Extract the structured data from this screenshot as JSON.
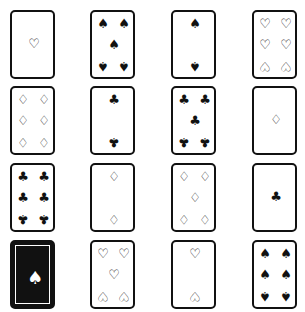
{
  "cards": [
    {
      "row": 1,
      "col": 1,
      "suit": "hearts",
      "count": 1,
      "symbol": "♡"
    },
    {
      "row": 1,
      "col": 2,
      "suit": "spades",
      "count": 5,
      "symbol": "♠"
    },
    {
      "row": 1,
      "col": 3,
      "suit": "spades",
      "count": 2,
      "symbol": "♠"
    },
    {
      "row": 1,
      "col": 4,
      "suit": "hearts",
      "count": 6,
      "symbol": "♡"
    },
    {
      "row": 2,
      "col": 1,
      "suit": "diamonds",
      "count": 6,
      "symbol": "♢"
    },
    {
      "row": 2,
      "col": 2,
      "suit": "clubs",
      "count": 2,
      "symbol": "♣"
    },
    {
      "row": 2,
      "col": 3,
      "suit": "clubs",
      "count": 5,
      "symbol": "♣"
    },
    {
      "row": 2,
      "col": 4,
      "suit": "diamonds",
      "count": 1,
      "symbol": "♢"
    },
    {
      "row": 3,
      "col": 1,
      "suit": "clubs",
      "count": 6,
      "symbol": "♣"
    },
    {
      "row": 3,
      "col": 2,
      "suit": "diamonds",
      "count": 2,
      "symbol": "♢"
    },
    {
      "row": 3,
      "col": 3,
      "suit": "diamonds",
      "count": 5,
      "symbol": "♢"
    },
    {
      "row": 3,
      "col": 4,
      "suit": "clubs",
      "count": 1,
      "symbol": "♣"
    },
    {
      "row": 4,
      "col": 1,
      "suit": "back",
      "count": 0,
      "symbol": "♠"
    },
    {
      "row": 4,
      "col": 2,
      "suit": "hearts",
      "count": 5,
      "symbol": "♡"
    },
    {
      "row": 4,
      "col": 3,
      "suit": "hearts",
      "count": 2,
      "symbol": "♡"
    },
    {
      "row": 4,
      "col": 4,
      "suit": "spades",
      "count": 6,
      "symbol": "♠"
    }
  ]
}
